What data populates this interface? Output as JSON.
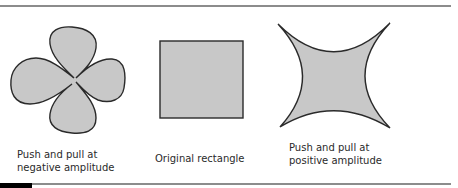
{
  "figure": {
    "panels": [
      {
        "id": "negative",
        "shape": "four-lobed-flower",
        "label": "Push and pull at\nnegative amplitude"
      },
      {
        "id": "original",
        "shape": "square",
        "label": "Original rectangle"
      },
      {
        "id": "positive",
        "shape": "concave-star",
        "label": "Push and pull at\npositive amplitude"
      }
    ],
    "colors": {
      "fill": "#c8c8c8",
      "stroke": "#2a2a2a",
      "rule": "#8c8c8c"
    }
  }
}
